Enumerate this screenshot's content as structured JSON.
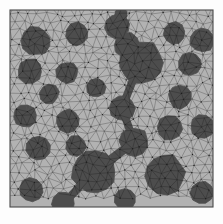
{
  "colors": {
    "page_background": "#fdfdfd",
    "matrix_fill": "#b2b2b2",
    "inclusion_fill": "#4d4d4d",
    "mesh_line": "#5a5a5a",
    "inclusion_mesh_line": "#2a2a2a",
    "domain_border": "#4a4a4a",
    "node_dot": "#1e1e1e"
  },
  "domain": {
    "x": 10,
    "y": 10,
    "width": 203,
    "height": 197,
    "border_width": 1.1,
    "shape": "square",
    "label": "RVE domain"
  },
  "mesh": {
    "type": "unstructured-triangular",
    "approx_cell_size": 9.0,
    "jitter": 2.7,
    "line_width": 0.45,
    "node_radius": 0.62,
    "seed": 20240617,
    "show_nodes": true,
    "show_grid": true
  },
  "chart_data": {
    "type": "scatter",
    "xlabel": "",
    "ylabel": "",
    "xlim": [
      10,
      213
    ],
    "ylim": [
      10,
      207
    ],
    "grid": false,
    "legend": null,
    "series": [
      {
        "name": "inclusions",
        "marker": "polygon",
        "color": "#4d4d4d",
        "count": 27,
        "points": [
          {
            "id": "inc-01",
            "x": 36,
            "y": 41,
            "r": 14.5,
            "sides": 11
          },
          {
            "id": "inc-02",
            "x": 77,
            "y": 34,
            "r": 11.5,
            "sides": 10
          },
          {
            "id": "inc-03",
            "x": 117,
            "y": 26,
            "r": 12.5,
            "sides": 10
          },
          {
            "id": "inc-04",
            "x": 121,
            "y": 14,
            "r": 6.5,
            "sides": 8
          },
          {
            "id": "inc-05",
            "x": 174,
            "y": 33,
            "r": 11.0,
            "sides": 10
          },
          {
            "id": "inc-06",
            "x": 202,
            "y": 40,
            "r": 12.5,
            "sides": 10
          },
          {
            "id": "inc-07",
            "x": 30,
            "y": 71,
            "r": 12.5,
            "sides": 10
          },
          {
            "id": "inc-08",
            "x": 67,
            "y": 73,
            "r": 11.0,
            "sides": 10
          },
          {
            "id": "inc-09",
            "x": 49,
            "y": 94,
            "r": 10.0,
            "sides": 9
          },
          {
            "id": "inc-10",
            "x": 96,
            "y": 88,
            "r": 9.5,
            "sides": 9
          },
          {
            "id": "inc-11",
            "x": 140,
            "y": 62,
            "r": 22.0,
            "sides": 13
          },
          {
            "id": "inc-12",
            "x": 127,
            "y": 45,
            "r": 13.0,
            "sides": 10
          },
          {
            "id": "inc-13",
            "x": 190,
            "y": 64,
            "r": 12.0,
            "sides": 10
          },
          {
            "id": "inc-14",
            "x": 180,
            "y": 97,
            "r": 11.5,
            "sides": 10
          },
          {
            "id": "inc-15",
            "x": 25,
            "y": 116,
            "r": 11.5,
            "sides": 10
          },
          {
            "id": "inc-16",
            "x": 68,
            "y": 121,
            "r": 12.0,
            "sides": 10
          },
          {
            "id": "inc-17",
            "x": 122,
            "y": 108,
            "r": 13.0,
            "sides": 10
          },
          {
            "id": "inc-18",
            "x": 170,
            "y": 128,
            "r": 12.5,
            "sides": 10
          },
          {
            "id": "inc-19",
            "x": 202,
            "y": 127,
            "r": 12.0,
            "sides": 10
          },
          {
            "id": "inc-20",
            "x": 38,
            "y": 148,
            "r": 12.5,
            "sides": 10
          },
          {
            "id": "inc-21",
            "x": 134,
            "y": 142,
            "r": 14.5,
            "sides": 11
          },
          {
            "id": "inc-22",
            "x": 94,
            "y": 172,
            "r": 22.0,
            "sides": 13
          },
          {
            "id": "inc-23",
            "x": 76,
            "y": 146,
            "r": 10.5,
            "sides": 9
          },
          {
            "id": "inc-24",
            "x": 165,
            "y": 174,
            "r": 20.0,
            "sides": 12
          },
          {
            "id": "inc-25",
            "x": 31,
            "y": 190,
            "r": 12.0,
            "sides": 10
          },
          {
            "id": "inc-26",
            "x": 63,
            "y": 204,
            "r": 12.0,
            "sides": 10
          },
          {
            "id": "inc-27",
            "x": 125,
            "y": 199,
            "r": 11.0,
            "sides": 10
          },
          {
            "id": "inc-28",
            "x": 202,
            "y": 193,
            "r": 11.5,
            "sides": 10
          }
        ],
        "bridges": [
          {
            "from": "inc-11",
            "to": "inc-17",
            "width": 4.0
          },
          {
            "from": "inc-17",
            "to": "inc-21",
            "width": 4.0
          },
          {
            "from": "inc-21",
            "to": "inc-22",
            "width": 4.5
          },
          {
            "from": "inc-03",
            "to": "inc-04",
            "width": 6.0
          },
          {
            "from": "inc-22",
            "to": "inc-26",
            "width": 4.0
          },
          {
            "from": "inc-12",
            "to": "inc-11",
            "width": 9.0
          }
        ]
      }
    ]
  },
  "caption": {
    "text": ""
  }
}
